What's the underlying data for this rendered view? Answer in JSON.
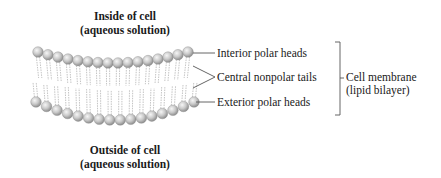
{
  "diagram": {
    "top_region": {
      "line1": "Inside of cell",
      "line2": "(aqueous solution)"
    },
    "bottom_region": {
      "line1": "Outside of cell",
      "line2": "(aqueous solution)"
    },
    "callouts": [
      {
        "label": "Interior polar heads"
      },
      {
        "label": "Central nonpolar tails"
      },
      {
        "label": "Exterior polar heads"
      }
    ],
    "bracket_label": {
      "line1": "Cell membrane",
      "line2": "(lipid bilayer)"
    },
    "colors": {
      "head_fill": "#c8c8c8",
      "head_highlight": "#f4f4f4",
      "tail": "#b5b5b5",
      "line": "#555555",
      "text": "#1a1a1a"
    },
    "heads_per_row": 16
  }
}
